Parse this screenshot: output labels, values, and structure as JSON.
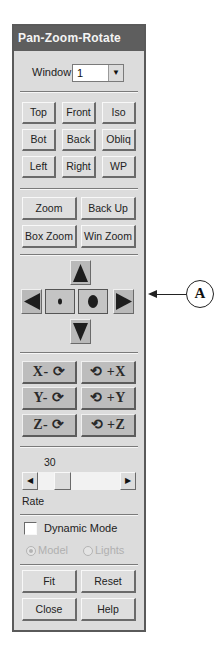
{
  "panel": {
    "title": "Pan-Zoom-Rotate",
    "window_label": "Window",
    "window_value": "1",
    "view_buttons": [
      "Top",
      "Front",
      "Iso",
      "Bot",
      "Back",
      "Obliq",
      "Left",
      "Right",
      "WP"
    ],
    "zoom_buttons": [
      "Zoom",
      "Back Up",
      "Box Zoom",
      "Win Zoom"
    ],
    "pan_controls": {
      "up": "pan-up-arrow",
      "left": "pan-left-arrow",
      "zoom_out": "small-dot",
      "zoom_in": "large-dot",
      "right": "pan-right-arrow",
      "down": "pan-down-arrow"
    },
    "rotate_buttons": [
      {
        "label": "X- ⟳",
        "axis": "X",
        "direction": "minus"
      },
      {
        "label": "⟲ +X",
        "axis": "X",
        "direction": "plus"
      },
      {
        "label": "Y- ⟳",
        "axis": "Y",
        "direction": "minus"
      },
      {
        "label": "⟲ +Y",
        "axis": "Y",
        "direction": "plus"
      },
      {
        "label": "Z- ⟳",
        "axis": "Z",
        "direction": "minus"
      },
      {
        "label": "⟲ +Z",
        "axis": "Z",
        "direction": "plus"
      }
    ],
    "rate_value": "30",
    "rate_label": "Rate",
    "dynamic_mode_label": "Dynamic Mode",
    "dynamic_mode_checked": false,
    "radio_model_label": "Model",
    "radio_lights_label": "Lights",
    "radio_selected": "Model",
    "bottom_buttons": [
      "Fit",
      "Reset",
      "Close",
      "Help"
    ]
  },
  "callout": {
    "label": "A"
  }
}
